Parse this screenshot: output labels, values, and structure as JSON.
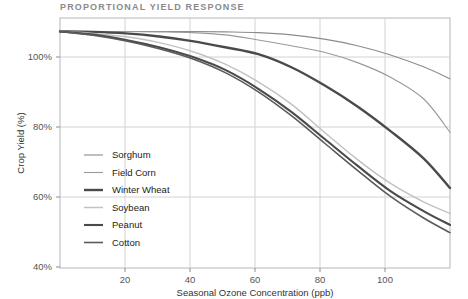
{
  "chart_data": {
    "type": "line",
    "title": "PROPORTIONAL YIELD RESPONSE",
    "xlabel": "Seasonal Ozone Concentration (ppb)",
    "ylabel": "Crop Yield (%)",
    "xlim": [
      0,
      118
    ],
    "ylim": [
      40,
      105
    ],
    "grid": true,
    "legend_position": "inside-left",
    "xticks": [
      20,
      40,
      60,
      80,
      100
    ],
    "xtick_labels": [
      "20",
      "40",
      "60",
      "80",
      "100"
    ],
    "yticks": [
      40,
      60,
      80,
      100
    ],
    "ytick_labels": [
      "40%",
      "60%",
      "80%",
      "100%"
    ],
    "x": [
      0,
      10,
      20,
      30,
      40,
      50,
      60,
      70,
      80,
      90,
      100,
      110,
      118
    ],
    "series": [
      {
        "name": "Sorghum",
        "color": "#8c8c8c",
        "width": 1.1,
        "values": [
          101.5,
          101.5,
          101.5,
          101.5,
          101.5,
          101.4,
          101.2,
          100.6,
          99.5,
          97.8,
          95.4,
          92.3,
          89.2
        ]
      },
      {
        "name": "Field Corn",
        "color": "#999999",
        "width": 1.1,
        "values": [
          101.5,
          101.5,
          101.5,
          101.4,
          101.2,
          100.6,
          99.3,
          97.8,
          96.1,
          93.4,
          89.6,
          84.0,
          75.3
        ]
      },
      {
        "name": "Winter Wheat",
        "color": "#4a4a4a",
        "width": 2.4,
        "values": [
          101.5,
          101.4,
          101.0,
          100.2,
          99.0,
          97.4,
          95.6,
          92.2,
          87.5,
          82.0,
          75.6,
          68.5,
          60.8
        ]
      },
      {
        "name": "Soybean",
        "color": "#c2c2c2",
        "width": 1.5,
        "values": [
          101.5,
          101.0,
          100.1,
          98.6,
          96.3,
          93.0,
          88.4,
          82.6,
          75.3,
          68.2,
          62.0,
          57.2,
          54.2
        ]
      },
      {
        "name": "Peanut",
        "color": "#4a4a4a",
        "width": 2.1,
        "values": [
          101.5,
          100.7,
          99.3,
          97.4,
          94.9,
          91.5,
          86.6,
          80.6,
          73.6,
          66.6,
          60.0,
          54.8,
          51.2
        ]
      },
      {
        "name": "Cotton",
        "color": "#5a5a5a",
        "width": 1.6,
        "values": [
          101.5,
          100.5,
          99.0,
          97.0,
          94.4,
          90.8,
          85.8,
          79.6,
          72.5,
          65.4,
          58.6,
          53.0,
          49.2
        ]
      }
    ]
  },
  "legend": {
    "items": [
      {
        "label": "Sorghum"
      },
      {
        "label": "Field Corn"
      },
      {
        "label": "Winter Wheat"
      },
      {
        "label": "Soybean"
      },
      {
        "label": "Peanut"
      },
      {
        "label": "Cotton"
      }
    ]
  }
}
